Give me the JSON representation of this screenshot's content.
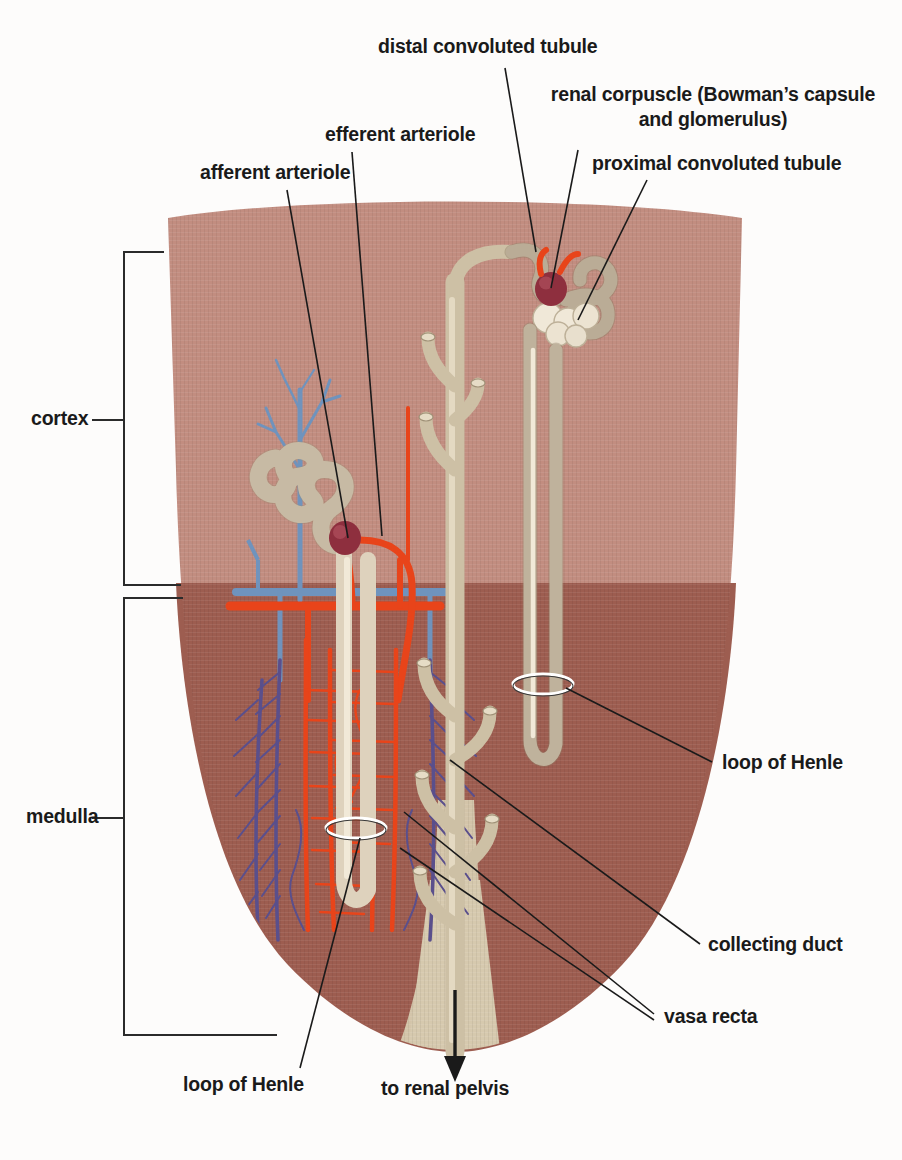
{
  "figure": {
    "type": "anatomical-diagram"
  },
  "colors": {
    "cortex": "#c28d80",
    "medulla": "#9d5d50",
    "tubule": "#ded2bd",
    "tubule_outline": "#8d7f67",
    "collecting_duct": "#cdc0a5",
    "glomerulus": "#8e2f3e",
    "artery": "#e8441a",
    "vein": "#6f93bd",
    "vasa_recta_vein": "#5a4f8c",
    "leader_line": "#1a1a1a",
    "bracket": "#2b2b2b",
    "label_text": "#1a1a1a",
    "background": "#ffffff"
  },
  "labels": {
    "distal_convoluted_tubule": "distal convoluted tubule",
    "renal_corpuscle": "renal corpuscle (Bowman’s capsule\nand glomerulus)",
    "renal_corpuscle_line1": "renal corpuscle (Bowman’s capsule",
    "renal_corpuscle_line2": "and glomerulus)",
    "proximal_convoluted_tubule": "proximal convoluted tubule",
    "efferent_arteriole": "efferent arteriole",
    "afferent_arteriole": "afferent arteriole",
    "cortex": "cortex",
    "medulla": "medulla",
    "loop_of_henle_right": "loop of Henle",
    "collecting_duct": "collecting duct",
    "vasa_recta": "vasa recta",
    "loop_of_henle_bottom": "loop of Henle",
    "to_renal_pelvis": "to renal pelvis"
  },
  "regions": [
    {
      "name": "cortex",
      "label": "cortex",
      "bracket_top": 252,
      "bracket_bottom": 585
    },
    {
      "name": "medulla",
      "label": "medulla",
      "bracket_top": 598,
      "bracket_bottom": 1035
    }
  ],
  "structures": [
    {
      "name": "renal-corpuscle-left",
      "label": "renal corpuscle (Bowman’s capsule and glomerulus)"
    },
    {
      "name": "renal-corpuscle-right",
      "label": "renal corpuscle (Bowman’s capsule and glomerulus)"
    },
    {
      "name": "proximal-convoluted-tubule",
      "label": "proximal convoluted tubule"
    },
    {
      "name": "distal-convoluted-tubule",
      "label": "distal convoluted tubule"
    },
    {
      "name": "afferent-arteriole",
      "label": "afferent arteriole"
    },
    {
      "name": "efferent-arteriole",
      "label": "efferent arteriole"
    },
    {
      "name": "loop-of-henle",
      "label": "loop of Henle"
    },
    {
      "name": "collecting-duct",
      "label": "collecting duct"
    },
    {
      "name": "vasa-recta",
      "label": "vasa recta"
    },
    {
      "name": "renal-pelvis-outflow",
      "label": "to renal pelvis"
    }
  ]
}
